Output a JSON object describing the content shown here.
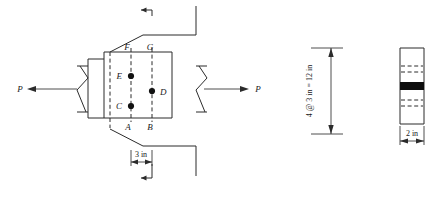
{
  "figure": {
    "load_labels": {
      "left": "P",
      "right": "P"
    },
    "hole_labels": {
      "a": "A",
      "b": "B",
      "c": "C",
      "d": "D",
      "e": "E",
      "f": "F",
      "g": "G"
    },
    "dimensions": {
      "horizontal_pitch": "3 in",
      "vertical_total": "4 @ 3 in = 12 in",
      "thickness": "2 in"
    },
    "section_marks": {
      "top": "section-cut-arrow-top",
      "bottom": "section-cut-arrow-bottom"
    },
    "icons": {
      "break_symbol_left": "break-line-icon",
      "break_symbol_right": "break-line-icon",
      "arrow_left": "arrow-left-icon",
      "arrow_right": "arrow-right-icon",
      "dim_arrow_up": "arrow-up-icon",
      "dim_arrow_down": "arrow-down-icon"
    },
    "colors": {
      "line": "#2b2b2b",
      "dash": "#2b2b2b",
      "dot": "#111111",
      "band": "#0d0d0d",
      "background": "#ffffff"
    }
  }
}
